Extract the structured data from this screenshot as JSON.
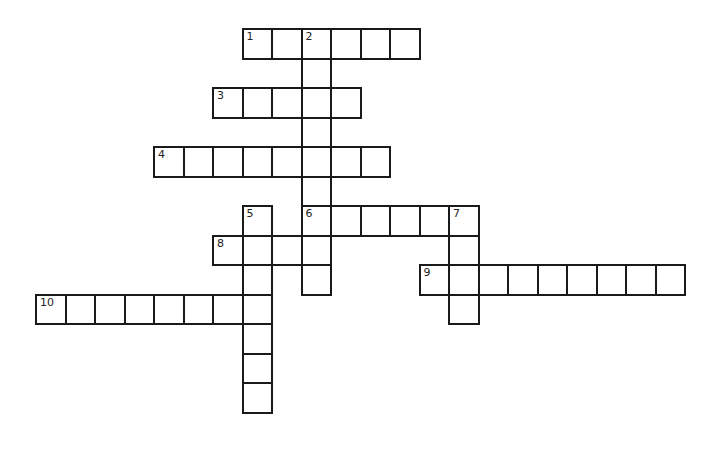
{
  "puzzle": {
    "type": "crossword",
    "cell_size": 29.5,
    "origin": {
      "x": 36,
      "y": 29
    },
    "colors": {
      "border": "#1a1a1a",
      "cell": "#ffffff",
      "number": "#222222"
    },
    "words": [
      {
        "number": "1",
        "direction": "across",
        "row": 0,
        "col": 7,
        "length": 6
      },
      {
        "number": "2",
        "direction": "down",
        "row": 0,
        "col": 9,
        "length": 9
      },
      {
        "number": "3",
        "direction": "across",
        "row": 2,
        "col": 6,
        "length": 5
      },
      {
        "number": "4",
        "direction": "across",
        "row": 4,
        "col": 4,
        "length": 8
      },
      {
        "number": "5",
        "direction": "down",
        "row": 6,
        "col": 7,
        "length": 7
      },
      {
        "number": "6",
        "direction": "across",
        "row": 6,
        "col": 9,
        "length": 6
      },
      {
        "number": "7",
        "direction": "down",
        "row": 6,
        "col": 14,
        "length": 4
      },
      {
        "number": "8",
        "direction": "across",
        "row": 7,
        "col": 6,
        "length": 4
      },
      {
        "number": "9",
        "direction": "across",
        "row": 8,
        "col": 13,
        "length": 9
      },
      {
        "number": "10",
        "direction": "across",
        "row": 9,
        "col": 0,
        "length": 8
      }
    ]
  }
}
